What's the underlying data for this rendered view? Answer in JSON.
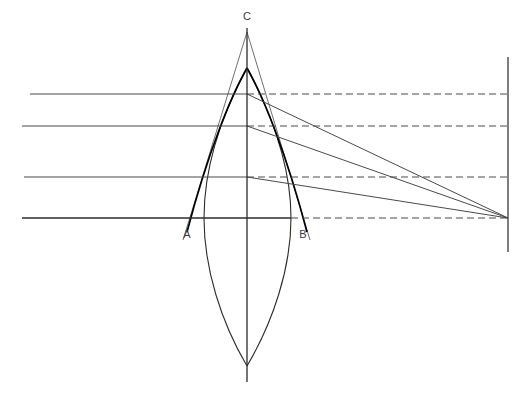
{
  "figure": {
    "type": "optics-ray-diagram",
    "canvas": {
      "width": 531,
      "height": 410,
      "background": "#ffffff"
    }
  },
  "colors": {
    "ray": "#4a4a4a",
    "ray_dashed": "#4a4a4a",
    "lens_outline": "#2b2b2b",
    "ideal_profile": "#000000",
    "axis": "#2b2b2b",
    "screen": "#3a3a3a",
    "label": "#3a3a3a"
  },
  "labels": [
    {
      "id": "C",
      "text": "C",
      "x": 247,
      "y": 20,
      "anchor": "middle"
    },
    {
      "id": "A",
      "text": "A",
      "x": 187,
      "y": 238,
      "anchor": "middle"
    },
    {
      "id": "B",
      "text": "B",
      "x": 303,
      "y": 238,
      "anchor": "middle"
    }
  ],
  "optical_axis": {
    "name": "optical-axis",
    "x": 247,
    "y_top": 28,
    "y_bottom": 382,
    "orientation": "vertical"
  },
  "screen_line": {
    "name": "image-screen",
    "x": 508,
    "y_top": 57,
    "y_bottom": 252
  },
  "focus_point": {
    "x": 508,
    "y": 218
  },
  "incoming_rays": [
    {
      "id": "ray-1",
      "y": 94,
      "x_start": 30,
      "x_end": 247,
      "height_from_axis": 124
    },
    {
      "id": "ray-2",
      "y": 126,
      "x_start": 22,
      "x_end": 247,
      "height_from_axis": 92
    },
    {
      "id": "ray-3",
      "y": 177,
      "x_start": 24,
      "x_end": 247,
      "height_from_axis": 41
    },
    {
      "id": "ray-4",
      "y": 218,
      "x_start": 22,
      "x_end": 508,
      "height_from_axis": 0,
      "note": "axial ray, undeviated"
    }
  ],
  "dashed_extensions": [
    {
      "id": "dash-1",
      "y": 94,
      "x_start": 247,
      "x_end": 508
    },
    {
      "id": "dash-2",
      "y": 126,
      "x_start": 247,
      "x_end": 508
    },
    {
      "id": "dash-3",
      "y": 177,
      "x_start": 247,
      "x_end": 508
    },
    {
      "id": "dash-4",
      "y": 218,
      "x_start": 291,
      "x_end": 508
    }
  ],
  "refracted_rays": [
    {
      "id": "refracted-1",
      "from_x": 247,
      "from_y": 94,
      "to_x": 508,
      "to_y": 218,
      "source_ray": "ray-1"
    },
    {
      "id": "refracted-2",
      "from_x": 247,
      "from_y": 126,
      "to_x": 508,
      "to_y": 218,
      "source_ray": "ray-2"
    },
    {
      "id": "refracted-3",
      "from_x": 247,
      "from_y": 177,
      "to_x": 508,
      "to_y": 218,
      "source_ray": "ray-3"
    }
  ],
  "lens_outline": {
    "name": "biconvex-lens",
    "apex_top": {
      "x": 247,
      "y": 68
    },
    "apex_bottom": {
      "x": 247,
      "y": 366
    },
    "left_extreme": {
      "x": 204,
      "y": 218
    },
    "right_extreme": {
      "x": 291,
      "y": 218
    }
  },
  "ideal_profile": {
    "name": "ideal-wavefront-profile",
    "apex": {
      "x": 247,
      "y": 68
    },
    "foot_left": {
      "x": 185,
      "y": 232
    },
    "foot_right": {
      "x": 308,
      "y": 232
    },
    "description": "heavy curved arcs from apex flaring outward to A and B"
  },
  "cone_lines": {
    "name": "aberration-cone",
    "apex": {
      "x": 247,
      "y": 32
    },
    "left_foot": {
      "x": 183,
      "y": 238
    },
    "right_foot": {
      "x": 310,
      "y": 238
    }
  }
}
